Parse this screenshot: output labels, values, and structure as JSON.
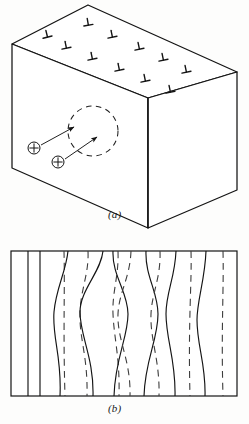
{
  "figure": {
    "ink_color": "#141414",
    "dash_color": "#4a4a4a",
    "background": "#fdfdfc"
  },
  "panels": [
    {
      "id": "a",
      "caption": "(a)",
      "description": "Isometric crystal block with edge-dislocation symbols on the top face and two interstitial point defects arrowed toward a dashed circular region on the front face",
      "block": {
        "name": "crystal-block",
        "vertices": {
          "top_back": [
            88,
            5
          ],
          "top_left": [
            12,
            44
          ],
          "top_front": [
            148,
            98
          ],
          "top_right": [
            237,
            72
          ],
          "bottom_left": [
            12,
            168
          ],
          "bottom_front": [
            148,
            228
          ],
          "bottom_right": [
            237,
            190
          ]
        }
      },
      "dislocation_symbol": "⊥",
      "dislocation_count": 11,
      "dislocations": [
        {
          "x": 47,
          "y": 35,
          "rot": -14
        },
        {
          "x": 88,
          "y": 23,
          "rot": -10
        },
        {
          "x": 66,
          "y": 46,
          "rot": -12
        },
        {
          "x": 112,
          "y": 35,
          "rot": -12
        },
        {
          "x": 92,
          "y": 57,
          "rot": -12
        },
        {
          "x": 139,
          "y": 47,
          "rot": -12
        },
        {
          "x": 119,
          "y": 68,
          "rot": -12
        },
        {
          "x": 163,
          "y": 58,
          "rot": -12
        },
        {
          "x": 145,
          "y": 79,
          "rot": -12
        },
        {
          "x": 186,
          "y": 70,
          "rot": -12
        },
        {
          "x": 170,
          "y": 90,
          "rot": -12
        }
      ],
      "dashed_circle": {
        "cx": 93,
        "cy": 131,
        "r": 25,
        "name": "dashed-region-circle"
      },
      "point_defects": [
        {
          "label": "+",
          "cx": 34,
          "cy": 148,
          "r": 6,
          "arrow_to": [
            76,
            126
          ]
        },
        {
          "label": "+",
          "cx": 58,
          "cy": 162,
          "r": 6,
          "arrow_to": [
            98,
            136
          ]
        }
      ]
    },
    {
      "id": "b",
      "caption": "(b)",
      "description": "Rectangular cross-section frame containing alternating solid and dashed wavy vertical lines",
      "frame": {
        "x": 11,
        "y": 251,
        "width": 226,
        "height": 145,
        "name": "cross-section-frame"
      },
      "lines": [
        {
          "style": "solid",
          "amp": 0,
          "x": 28
        },
        {
          "style": "solid",
          "amp": 0,
          "x": 40
        },
        {
          "style": "dashed",
          "amp": 1,
          "x": 66
        },
        {
          "style": "solid",
          "amp": 7,
          "x": 93
        },
        {
          "style": "dashed",
          "amp": 9,
          "x": 117
        },
        {
          "style": "solid",
          "amp": 9,
          "x": 132
        },
        {
          "style": "dashed",
          "amp": 9,
          "x": 157
        },
        {
          "style": "solid",
          "amp": 10,
          "x": 170
        },
        {
          "style": "dashed",
          "amp": 9,
          "x": 196
        },
        {
          "style": "solid",
          "amp": 7,
          "x": 210
        },
        {
          "style": "dashed",
          "amp": 4,
          "x": 228
        },
        {
          "style": "solid",
          "amp": 4,
          "x": 244
        },
        {
          "style": "dashed",
          "amp": 2,
          "x": 264
        }
      ]
    }
  ]
}
